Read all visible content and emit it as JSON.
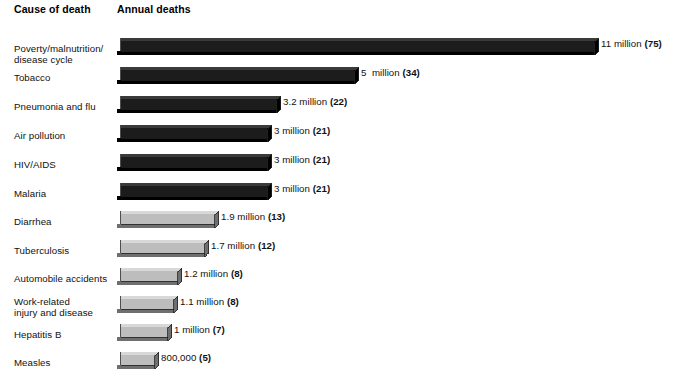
{
  "header": {
    "col_category": "Cause of death",
    "col_value": "Annual deaths"
  },
  "colors": {
    "dark_bar": "#1c1c1c",
    "dark_bar_top": "#3a3a3a",
    "dark_bar_side": "#000000",
    "light_bar": "#bdbdbd",
    "light_bar_top": "#d8d8d8",
    "light_bar_side": "#6f6f6f",
    "outline": "#222222",
    "text": "#111111",
    "background": "#ffffff"
  },
  "chart_data": {
    "type": "bar",
    "orientation": "horizontal",
    "title": "",
    "xlabel": "Annual deaths",
    "ylabel": "Cause of death",
    "grid": false,
    "legend": "none",
    "xlim": [
      0,
      11
    ],
    "units": "millions of deaths per year",
    "note": "Number in parentheses is percent-style index shown after each value label",
    "categories": [
      "Poverty/malnutrition/\ndisease cycle",
      "Tobacco",
      "Pneumonia and flu",
      "Air pollution",
      "HIV/AIDS",
      "Malaria",
      "Diarrhea",
      "Tuberculosis",
      "Automobile accidents",
      "Work-related\ninjury and disease",
      "Hepatitis B",
      "Measles"
    ],
    "values": [
      11,
      5,
      3.2,
      3,
      3,
      3,
      1.9,
      1.7,
      1.2,
      1.1,
      1,
      0.8
    ],
    "value_labels": [
      "11 million ",
      "5  million ",
      "3.2 million ",
      "3 million ",
      "3 million ",
      "3 million ",
      "1.9 million ",
      "1.7 million ",
      "1.2 million ",
      "1.1 million ",
      "1 million ",
      "800,000 "
    ],
    "index_labels": [
      "(75)",
      "(34)",
      "(22)",
      "(21)",
      "(21)",
      "(21)",
      "(13)",
      "(12)",
      "(8)",
      "(8)",
      "(7)",
      "(5)"
    ],
    "bar_styles": [
      "dark",
      "dark",
      "dark",
      "dark",
      "dark",
      "dark",
      "light",
      "light",
      "light",
      "light",
      "light",
      "light"
    ]
  },
  "geometry": {
    "rows": [
      {
        "bar_top": 38,
        "label_top": 43,
        "bar_px": 478
      },
      {
        "bar_top": 67,
        "label_top": 72,
        "bar_px": 238
      },
      {
        "bar_top": 96,
        "label_top": 101,
        "bar_px": 160
      },
      {
        "bar_top": 125,
        "label_top": 130,
        "bar_px": 151
      },
      {
        "bar_top": 154,
        "label_top": 159,
        "bar_px": 151
      },
      {
        "bar_top": 183,
        "label_top": 188,
        "bar_px": 151
      },
      {
        "bar_top": 211,
        "label_top": 216,
        "bar_px": 98
      },
      {
        "bar_top": 240,
        "label_top": 245,
        "bar_px": 88
      },
      {
        "bar_top": 268,
        "label_top": 273,
        "bar_px": 61
      },
      {
        "bar_top": 296,
        "label_top": 296,
        "bar_px": 57
      },
      {
        "bar_top": 324,
        "label_top": 329,
        "bar_px": 51
      },
      {
        "bar_top": 352,
        "label_top": 357,
        "bar_px": 38
      }
    ]
  }
}
